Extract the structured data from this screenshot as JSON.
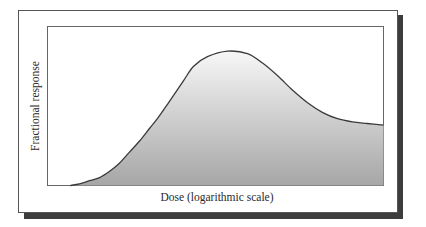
{
  "chart_data": {
    "type": "area",
    "title": "",
    "xlabel": "Dose (logarithmic scale)",
    "ylabel": "Fractional response",
    "x_scale": "log",
    "grid": false,
    "legend": null,
    "tick_labels": {
      "x": [],
      "y": []
    },
    "xlim": [
      0,
      1
    ],
    "ylim": [
      0,
      1
    ],
    "x": [
      0.068,
      0.095,
      0.125,
      0.155,
      0.185,
      0.214,
      0.244,
      0.274,
      0.304,
      0.327,
      0.36,
      0.405,
      0.435,
      0.476,
      0.536,
      0.595,
      0.64,
      0.685,
      0.729,
      0.774,
      0.818,
      0.863,
      0.908,
      0.952,
      1.0
    ],
    "values": [
      0.0,
      0.01,
      0.03,
      0.05,
      0.09,
      0.14,
      0.21,
      0.28,
      0.36,
      0.42,
      0.52,
      0.66,
      0.75,
      0.81,
      0.845,
      0.83,
      0.77,
      0.69,
      0.6,
      0.52,
      0.46,
      0.42,
      0.4,
      0.39,
      0.38
    ],
    "series": [
      {
        "name": "Fractional response",
        "fill": "vertical-gradient",
        "fill_top": "#f7f7f7",
        "fill_bottom": "#a6a6a6",
        "line_color": "#3a3a3a"
      }
    ],
    "annotations": [],
    "frame": {
      "style": "bordered-box-with-drop-shadow",
      "shadow_color": "#3c3c3c"
    }
  }
}
